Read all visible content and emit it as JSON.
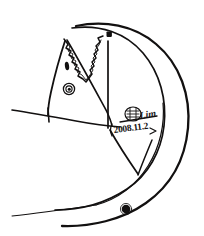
{
  "artwork": {
    "title": "Hand-drawn ink sketch",
    "medium": "pen and ink on white paper",
    "background_color": "#ffffff",
    "ink_color": "#121010",
    "subject": "crescent arc enclosing a triangular form with zigzag sawtooth teeth, round eye marks and filled dots",
    "signature": {
      "stamp_label": "seal-stamp",
      "name": "Lim",
      "date": "2008.11.2"
    },
    "elements": [
      {
        "name": "outer-crescent-arc",
        "description": "large sweeping crescent from top-left to bottom-left"
      },
      {
        "name": "inner-crescent-arc",
        "description": "second parallel arc inside the crescent"
      },
      {
        "name": "triangle-body",
        "description": "angular triangular form at upper left"
      },
      {
        "name": "zigzag-teeth",
        "description": "sawtooth V pattern across the triangle"
      },
      {
        "name": "eye-spiral",
        "description": "small spiral circle eye"
      },
      {
        "name": "nostril-dot",
        "description": "small dark oval"
      },
      {
        "name": "top-square-dot",
        "description": "filled square dot near apex"
      },
      {
        "name": "bottom-round-dot",
        "description": "filled round dot near base"
      },
      {
        "name": "horizon-line",
        "description": "long horizontal line crossing the figure"
      },
      {
        "name": "lower-baseline",
        "description": "long shallow line along the bottom"
      },
      {
        "name": "diagonal-strokes",
        "description": "two converging diagonal lines from the center"
      }
    ]
  }
}
